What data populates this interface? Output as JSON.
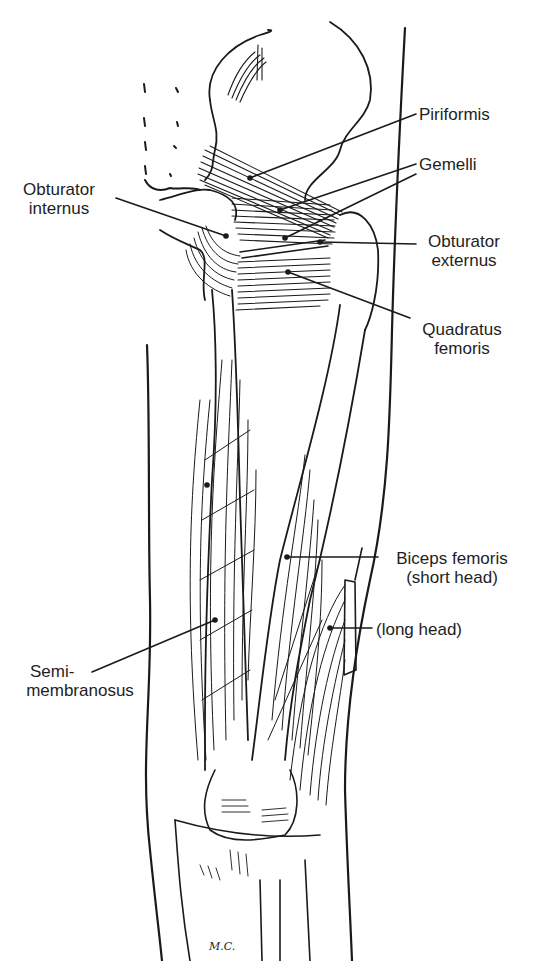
{
  "figure": {
    "type": "anatomical-line-drawing",
    "signature": "M.C.",
    "line_color": "#1a1a1a",
    "background_color": "#ffffff"
  },
  "labels": {
    "piriformis": "Piriformis",
    "gemelli": "Gemelli",
    "obturator_internus_line1": "Obturator",
    "obturator_internus_line2": "internus",
    "obturator_externus_line1": "Obturator",
    "obturator_externus_line2": "externus",
    "quadratus_femoris_line1": "Quadratus",
    "quadratus_femoris_line2": "femoris",
    "biceps_short_line1": "Biceps femoris",
    "biceps_short_line2": "(short head)",
    "biceps_long": "(long head)",
    "semimembranosus_line1": "Semi-",
    "semimembranosus_line2": "membranosus"
  }
}
